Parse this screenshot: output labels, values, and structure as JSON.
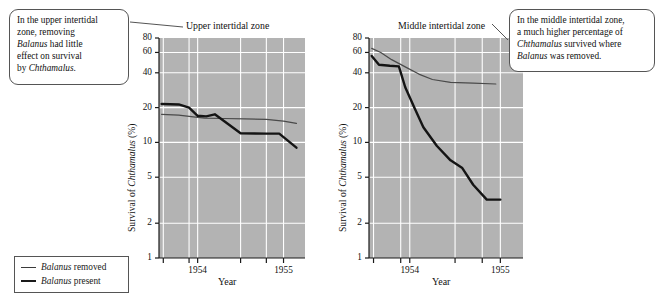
{
  "figure": {
    "background": "#ffffff",
    "plot_background": "#b3b3b3",
    "gridline_color": "#ffffff",
    "line_removed_color": "#4a4a4a",
    "line_present_color": "#141414"
  },
  "callouts": {
    "left": {
      "lines": [
        "In the upper intertidal",
        "zone, removing",
        "Balanus had little",
        "effect on survival",
        "by Chthamalus."
      ],
      "italic_words": [
        "Balanus",
        "Chthamalus"
      ]
    },
    "right": {
      "lines": [
        "In the middle intertidal zone,",
        "a much higher percentage of",
        "Chthamalus survived where",
        "Balanus was removed."
      ],
      "italic_words": [
        "Chthamalus",
        "Balanus"
      ]
    }
  },
  "legend": {
    "items": [
      {
        "label_italic": "Balanus",
        "label_rest": " removed",
        "style": "thin"
      },
      {
        "label_italic": "Balanus",
        "label_rest": " present",
        "style": "thick"
      }
    ]
  },
  "chart_data": [
    {
      "type": "line",
      "title": "Upper intertidal zone",
      "xlabel": "Year",
      "ylabel_pre": "Survival of ",
      "ylabel_italic": "Chthamalus",
      "ylabel_post": " (%)",
      "yscale": "log",
      "ylim": [
        1,
        80
      ],
      "yticks": [
        1,
        2,
        5,
        10,
        20,
        40,
        60,
        80
      ],
      "ytick_labels": [
        "1",
        "2",
        "5",
        "10",
        "20",
        "40",
        "60",
        "80"
      ],
      "xlim": [
        1953.55,
        1955.25
      ],
      "xticks": [
        1953.6,
        1953.9,
        1954.0,
        1954.5,
        1954.8,
        1955.0
      ],
      "xtick_labels": [
        "",
        "",
        "1954",
        "",
        "",
        "1955"
      ],
      "grid": true,
      "series": [
        {
          "name": "Balanus removed",
          "style": "thin",
          "x": [
            1953.58,
            1953.78,
            1953.95,
            1954.08,
            1954.3,
            1954.55,
            1954.8,
            1955.0,
            1955.15
          ],
          "y": [
            17.5,
            17.2,
            16.6,
            16.2,
            16.1,
            16.0,
            15.8,
            15.3,
            14.6
          ]
        },
        {
          "name": "Balanus present",
          "style": "thick",
          "x": [
            1953.58,
            1953.78,
            1953.9,
            1954.0,
            1954.1,
            1954.2,
            1954.35,
            1954.5,
            1954.8,
            1954.95,
            1955.15
          ],
          "y": [
            21.5,
            21.3,
            20.0,
            17.0,
            16.8,
            17.5,
            14.5,
            12.0,
            11.9,
            11.9,
            9.0
          ]
        }
      ]
    },
    {
      "type": "line",
      "title": "Middle intertidal zone",
      "xlabel": "Year",
      "ylabel_pre": "Survival of ",
      "ylabel_italic": "Chthamalus",
      "ylabel_post": " (%)",
      "yscale": "log",
      "ylim": [
        1,
        80
      ],
      "yticks": [
        1,
        2,
        5,
        10,
        20,
        40,
        60,
        80
      ],
      "ytick_labels": [
        "1",
        "2",
        "5",
        "10",
        "20",
        "40",
        "60",
        "80"
      ],
      "xlim": [
        1953.55,
        1955.25
      ],
      "xticks": [
        1953.6,
        1953.9,
        1954.0,
        1954.5,
        1954.8,
        1955.0
      ],
      "xtick_labels": [
        "",
        "",
        "1954",
        "",
        "",
        "1955"
      ],
      "grid": true,
      "series": [
        {
          "name": "Balanus removed",
          "style": "thin",
          "x": [
            1953.58,
            1953.68,
            1953.8,
            1953.95,
            1954.1,
            1954.25,
            1954.45,
            1954.7,
            1954.95
          ],
          "y": [
            65.0,
            60.0,
            52.0,
            45.0,
            39.0,
            35.0,
            33.0,
            32.5,
            32.0
          ]
        },
        {
          "name": "Balanus present",
          "style": "thick",
          "x": [
            1953.58,
            1953.66,
            1953.78,
            1953.88,
            1953.95,
            1954.05,
            1954.15,
            1954.3,
            1954.45,
            1954.58,
            1954.7,
            1954.85,
            1955.0
          ],
          "y": [
            56.0,
            47.0,
            46.0,
            45.5,
            30.0,
            20.0,
            13.5,
            9.3,
            7.0,
            6.0,
            4.3,
            3.2,
            3.2
          ]
        }
      ]
    }
  ]
}
